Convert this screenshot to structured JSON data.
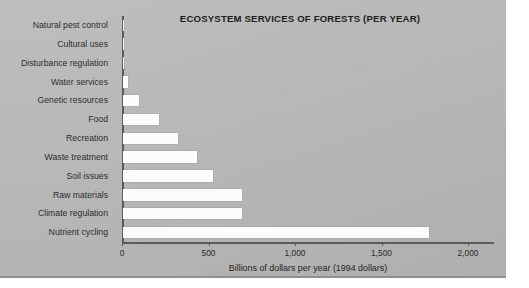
{
  "chart_data": {
    "type": "bar",
    "orientation": "horizontal",
    "title": "ECOSYSTEM SERVICES OF FORESTS (PER YEAR)",
    "xlabel": "Billions of dollars per year (1994 dollars)",
    "ylabel": "",
    "xlim": [
      0,
      2150
    ],
    "xticks": [
      0,
      500,
      1000,
      1500,
      2000
    ],
    "xtick_labels": [
      "0",
      "500",
      "1,000",
      "1,500",
      "2,000"
    ],
    "grid": false,
    "legend": false,
    "bar_color": "#fdfdfd",
    "categories": [
      "Natural pest control",
      "Cultural uses",
      "Disturbance regulation",
      "Water services",
      "Genetic resources",
      "Food",
      "Recreation",
      "Waste treatment",
      "Soil issues",
      "Raw materials",
      "Climate regulation",
      "Nutrient cycling"
    ],
    "values": [
      4,
      6,
      8,
      30,
      90,
      210,
      320,
      430,
      520,
      690,
      690,
      1770
    ]
  },
  "figure": {
    "background_color": "#b9b9b9",
    "text_color": "#2d2d2d",
    "axis_color": "#5a5a5a"
  }
}
